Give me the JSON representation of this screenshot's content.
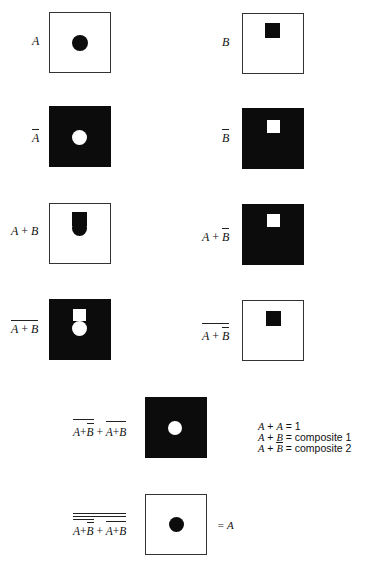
{
  "panels": [
    {
      "id": "A",
      "label": "A",
      "background": "white",
      "shape": "circle",
      "shape_color": "#0c0c0c"
    },
    {
      "id": "B",
      "label": "B",
      "background": "white",
      "shape": "square",
      "shape_color": "#0c0c0c"
    },
    {
      "id": "not-A",
      "label": "A",
      "overbar": true,
      "background": "black",
      "shape": "circle",
      "shape_color": "#ffffff"
    },
    {
      "id": "not-B",
      "label": "B",
      "overbar": true,
      "background": "black",
      "shape": "square",
      "shape_color": "#ffffff"
    },
    {
      "id": "A-plus-B",
      "label_parts": [
        "A",
        "+",
        "B"
      ],
      "background": "white",
      "shape": "square+circle",
      "shape_color": "#0c0c0c"
    },
    {
      "id": "A-plus-notB",
      "label_parts": [
        "A",
        "+",
        "B"
      ],
      "b_overbar": true,
      "background": "black",
      "shape": "square",
      "shape_color": "#ffffff"
    },
    {
      "id": "not-A-plus-B",
      "label_parts": [
        "A",
        "+",
        "B"
      ],
      "whole_overbar": true,
      "background": "black",
      "shape": "square+circle",
      "shape_color": "#ffffff"
    },
    {
      "id": "not-A-plus-notB",
      "label_parts": [
        "A",
        "+",
        "B"
      ],
      "whole_overbar": true,
      "b_overbar": true,
      "background": "white",
      "shape": "square",
      "shape_color": "#0c0c0c"
    },
    {
      "id": "composite-sum",
      "label_parts": [
        "A+B",
        "+",
        "A+B"
      ],
      "background": "black",
      "shape": "circle",
      "shape_color": "#ffffff"
    },
    {
      "id": "final",
      "label_parts": [
        "A+B",
        "+",
        "A+B"
      ],
      "double_overbar": true,
      "background": "white",
      "shape": "circle",
      "shape_color": "#0c0c0c",
      "result": "= A"
    }
  ],
  "text": {
    "A": "A",
    "B": "B",
    "plus": "+",
    "eq_A": "= A"
  },
  "legend": {
    "rows": [
      {
        "lhs_a": "A",
        "op": " + ",
        "lhs_b": "A",
        "eq": " = ",
        "rhs": "1"
      },
      {
        "lhs_a": "A",
        "op": " + ",
        "lhs_b": "B",
        "eq": " = ",
        "rhs": "composite  1"
      },
      {
        "lhs_a": "A",
        "op": " + ",
        "lhs_b": "B",
        "eq": " = ",
        "rhs": "composite  2"
      }
    ]
  },
  "colors": {
    "black": "#0c0c0c",
    "white": "#ffffff",
    "border": "#333333"
  }
}
